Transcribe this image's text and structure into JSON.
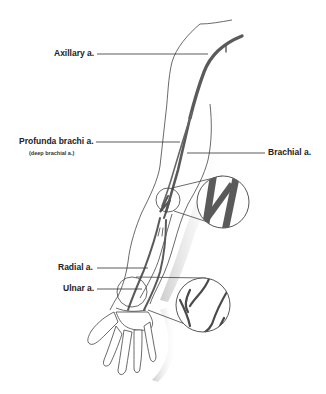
{
  "diagram": {
    "colors": {
      "artery": "#555555",
      "outline": "#444444",
      "leader_line": "#333333",
      "shadow": "#bbbbbb",
      "background": "#ffffff"
    },
    "labels": [
      {
        "id": "axillary",
        "text": "Axillary a."
      },
      {
        "id": "profunda",
        "text": "Profunda brachi a.",
        "subtext": "(deep brachial a.)"
      },
      {
        "id": "brachial",
        "text": "Brachial a."
      },
      {
        "id": "radial",
        "text": "Radial a."
      },
      {
        "id": "ulnar",
        "text": "Ulnar a."
      }
    ],
    "callouts": [
      {
        "id": "elbow-magnifier",
        "description": "Magnified view of brachial bifurcation at elbow"
      },
      {
        "id": "wrist-magnifier",
        "description": "Magnified view of arteries at wrist"
      }
    ]
  }
}
